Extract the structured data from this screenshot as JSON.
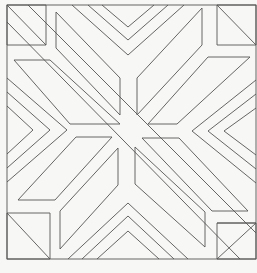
{
  "figure": {
    "type": "quilt-block-line-drawing",
    "stroke_color": "#555555",
    "background_color": "#f7f7f5",
    "frame": {
      "x": 7,
      "y": 5,
      "w": 249,
      "h": 254
    },
    "shapes": [
      {
        "name": "corner-square-top-left",
        "d": "M7,5 L46,5 L46,45 L7,45 Z M7,5 L46,45"
      },
      {
        "name": "corner-square-top-right",
        "d": "M217,5 L256,5 L256,45 L217,45 Z M217,5 L256,45"
      },
      {
        "name": "corner-square-bottom-left",
        "d": "M7,213 L50,213 L50,259 L7,259 Z M7,213 L50,259"
      },
      {
        "name": "corner-square-bottom-right",
        "d": "M217,223 L256,223 L256,259 L217,259 Z M217,259 L256,223 L217,223"
      },
      {
        "name": "chevron-top-outer",
        "d": "M72,5 L128,55 L184,5"
      },
      {
        "name": "chevron-top-middle",
        "d": "M88,5 L128,40 L168,5"
      },
      {
        "name": "chevron-top-inner",
        "d": "M102,5 L128,27 L154,5"
      },
      {
        "name": "chevron-bottom-outer",
        "d": "M68,259 L128,203 L188,259"
      },
      {
        "name": "chevron-bottom-middle",
        "d": "M82,259 L128,216 L174,259"
      },
      {
        "name": "chevron-bottom-inner",
        "d": "M97,259 L128,231 L159,259"
      },
      {
        "name": "chevron-left-outer",
        "d": "M7,78 L67,130 L7,182"
      },
      {
        "name": "chevron-left-middle",
        "d": "M7,92 L50,130 L7,168"
      },
      {
        "name": "chevron-left-inner",
        "d": "M7,106 L33,130 L7,154"
      },
      {
        "name": "chevron-right-outer",
        "d": "M256,80 L192,131 L256,183"
      },
      {
        "name": "chevron-right-middle",
        "d": "M256,94 L208,131 L256,169"
      },
      {
        "name": "chevron-right-inner",
        "d": "M256,108 L224,131 L256,155"
      },
      {
        "name": "parallelogram-top-left-upper",
        "d": "M56,12 L56,48 L120,115 L120,78 Z"
      },
      {
        "name": "parallelogram-top-left-lower",
        "d": "M14,60 L50,60 L120,124 L70,124 Z"
      },
      {
        "name": "parallelogram-top-right-upper",
        "d": "M202,8 L202,45 L137,115 L137,78 Z"
      },
      {
        "name": "parallelogram-top-right-lower",
        "d": "M208,57 L250,57 L177,124 L148,124 Z"
      },
      {
        "name": "parallelogram-bottom-left-upper",
        "d": "M76,137 L112,137 L55,200 L18,200 Z"
      },
      {
        "name": "parallelogram-bottom-left-lower",
        "d": "M118,148 L118,185 L60,249 L60,211 Z"
      },
      {
        "name": "parallelogram-bottom-right-upper",
        "d": "M135,147 L135,184 L205,247 L205,212 Z"
      },
      {
        "name": "parallelogram-bottom-right-lower",
        "d": "M142,138 L179,138 L248,211 L212,211 Z"
      },
      {
        "name": "diagonal-band-nw-se-a",
        "d": "M28,5 L256,233"
      },
      {
        "name": "diagonal-band-nw-se-b",
        "d": "M7,22 L240,259"
      }
    ]
  }
}
